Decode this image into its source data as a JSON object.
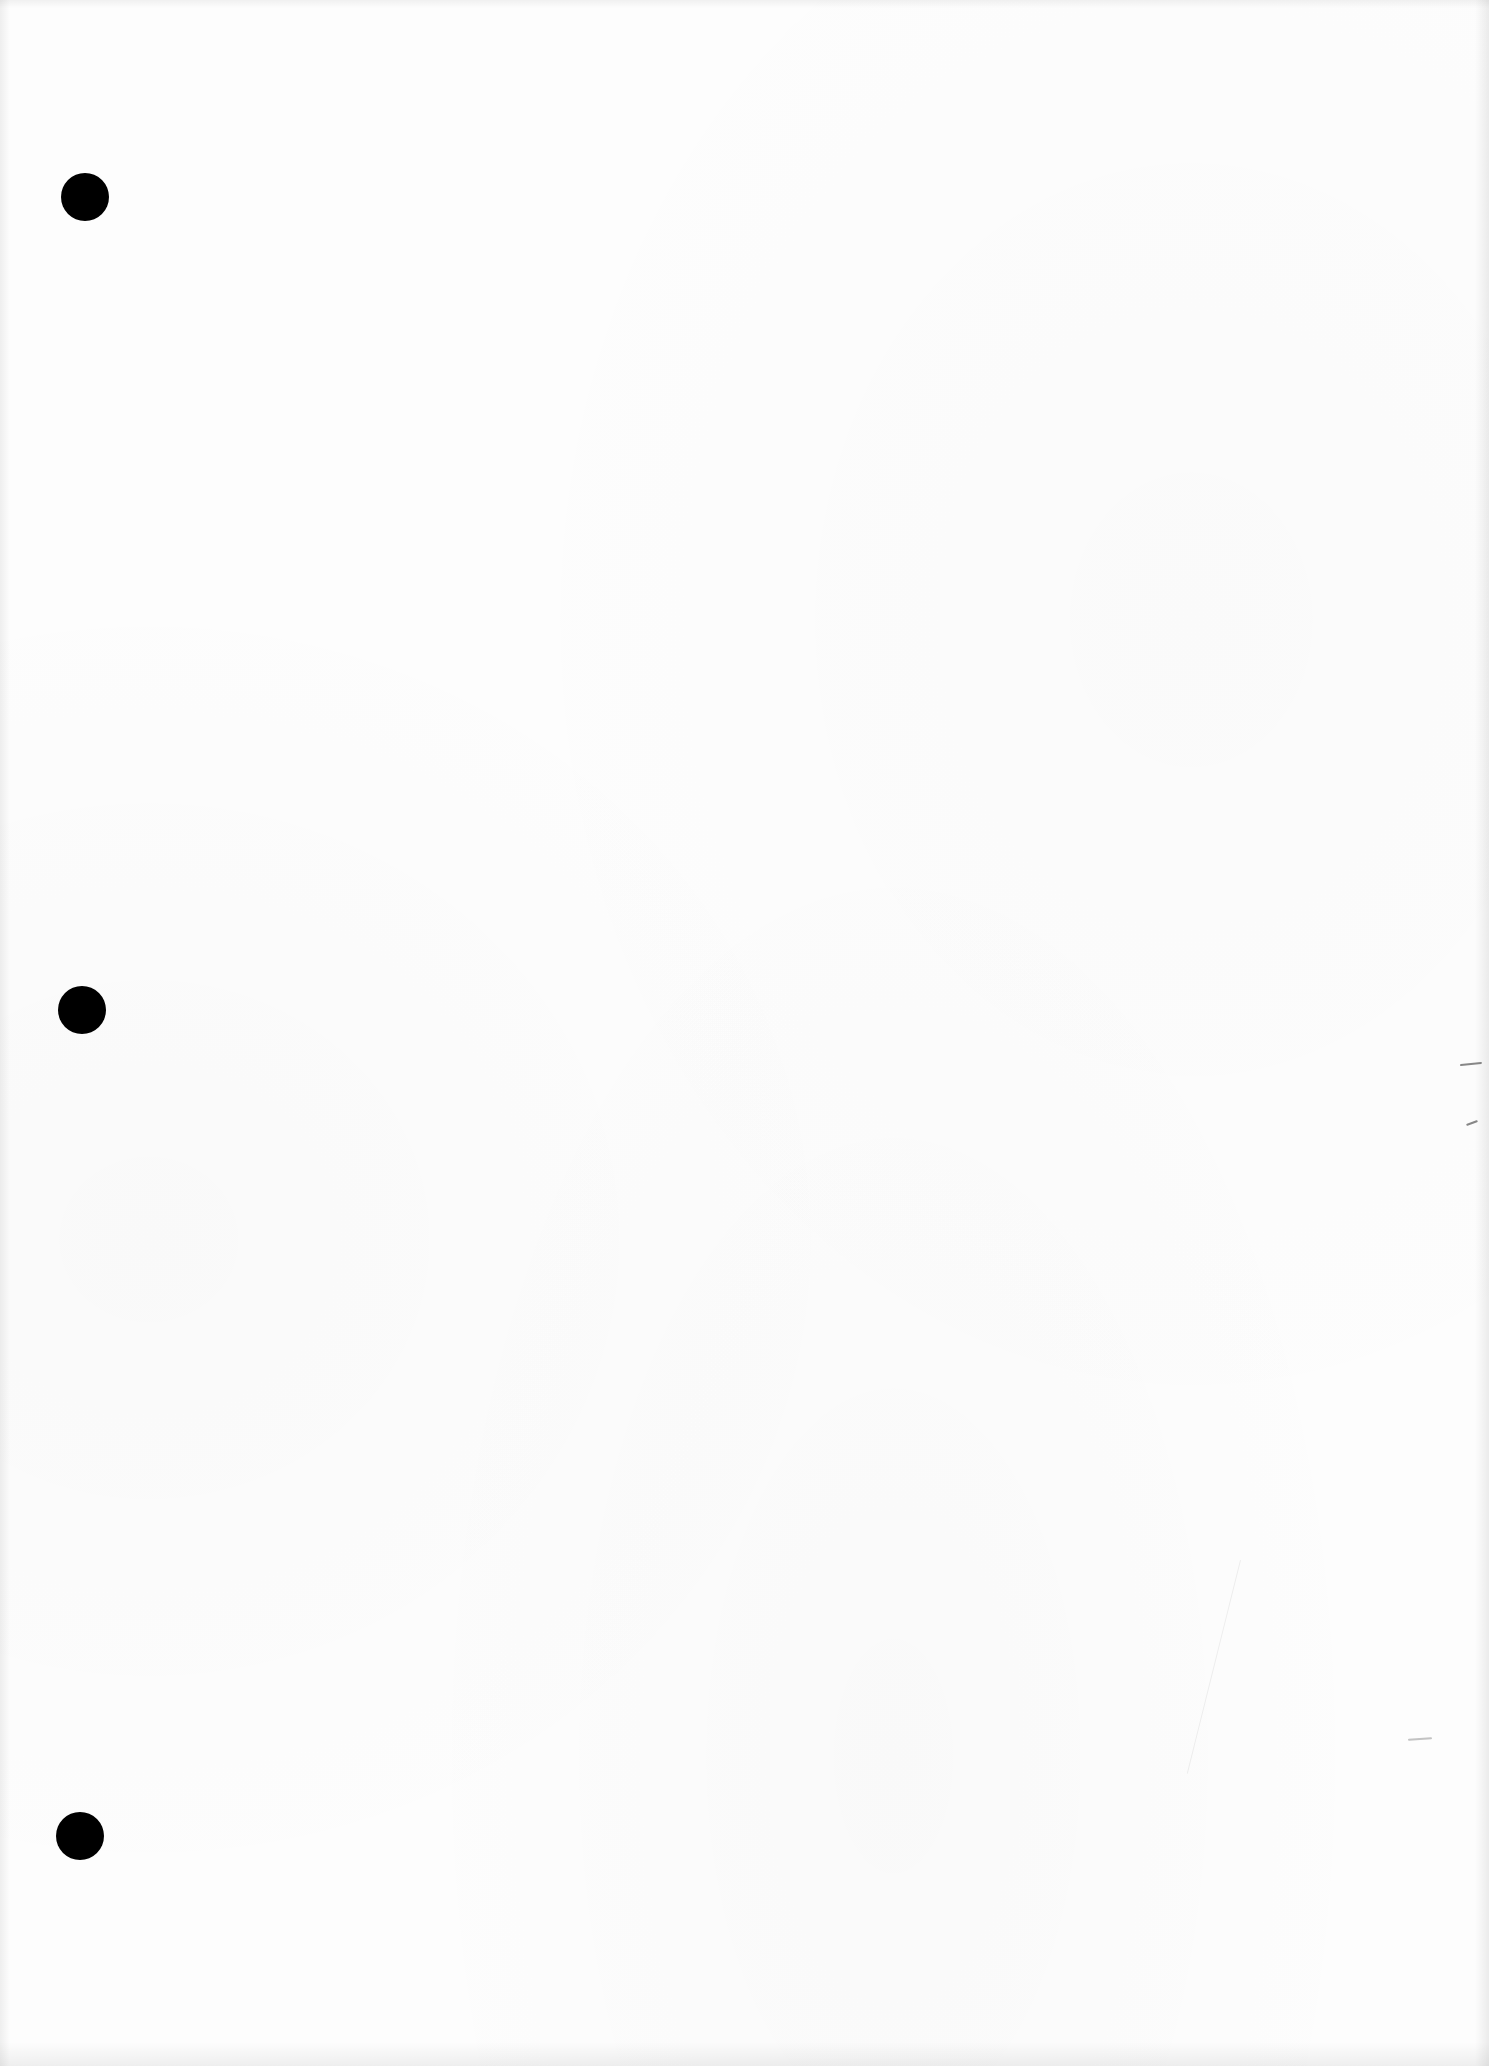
{
  "document": {
    "type": "scanned blank page",
    "background_color": "#fdfdfd",
    "text_content": "",
    "punch_holes": [
      {
        "position": "top-left",
        "color": "#000000"
      },
      {
        "position": "middle-left",
        "color": "#000000"
      },
      {
        "position": "bottom-left",
        "color": "#000000"
      }
    ],
    "hole_count": 3
  }
}
